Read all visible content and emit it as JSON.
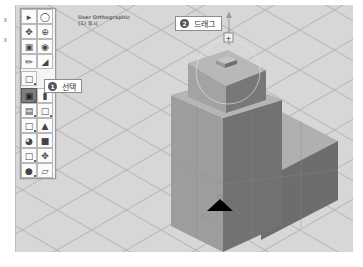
{
  "viewport": {
    "view_name": "User Orthographic",
    "view_sub": "(1) 투시",
    "background": "#d7d7d7"
  },
  "toolbar": {
    "buttons": [
      {
        "row": 0,
        "icons": [
          "select-arrow-icon",
          "orbit-icon"
        ]
      },
      {
        "row": 1,
        "icons": [
          "pan-move-icon",
          "rotate-view-icon"
        ]
      },
      {
        "row": 2,
        "icons": [
          "scale-icon",
          "snap-target-icon"
        ]
      },
      {
        "row": 3,
        "icons": [
          "pencil-draw-icon",
          "ruler-angle-icon"
        ]
      },
      {
        "row": 4,
        "icons": [
          "add-object-icon"
        ]
      },
      {
        "row": 5,
        "icons": [
          "extrude-face-icon",
          "face-tool-icon"
        ],
        "active": 0
      },
      {
        "row": 6,
        "icons": [
          "open-box-icon",
          "cube-outline-icon"
        ]
      },
      {
        "row": 7,
        "icons": [
          "cube-wire-icon",
          "house-shape-icon"
        ]
      },
      {
        "row": 8,
        "icons": [
          "paint-bucket-icon",
          "solid-block-icon"
        ]
      },
      {
        "row": 9,
        "icons": [
          "box-select-icon",
          "gizmo-move-icon"
        ]
      },
      {
        "row": 10,
        "icons": [
          "material-icon",
          "plane-icon"
        ]
      }
    ]
  },
  "callouts": [
    {
      "number": "1",
      "label": "선택"
    },
    {
      "number": "2",
      "label": "드래그"
    }
  ],
  "colors": {
    "grid_line": "#a8a8a8",
    "left_face": "#9c9c9c",
    "right_face": "#6f6f6f",
    "top_face": "#b3b3b3",
    "gizmo": "#000000"
  }
}
